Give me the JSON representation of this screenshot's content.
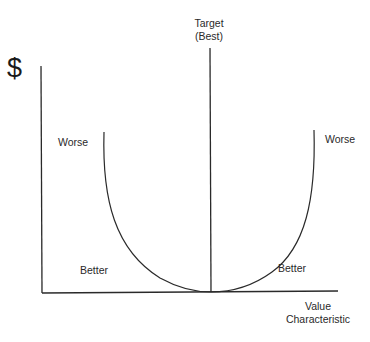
{
  "diagram": {
    "y_axis_symbol": "$",
    "x_axis_label_line1": "Value",
    "x_axis_label_line2": "Characteristic",
    "target_label_line1": "Target",
    "target_label_line2": "(Best)",
    "labels": {
      "left_worse": "Worse",
      "right_worse": "Worse",
      "left_better": "Better",
      "right_better": "Better"
    },
    "colors": {
      "line": "#2a2a2a",
      "background": "#ffffff"
    }
  }
}
